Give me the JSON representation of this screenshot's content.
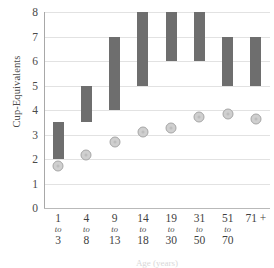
{
  "chart_data": {
    "type": "bar",
    "title": "",
    "xlabel": "Age (years)",
    "ylabel": "Cup-Equivalents",
    "ylim": [
      0,
      8
    ],
    "grid": true,
    "legend": "none",
    "categories": [
      "1 to 3",
      "4 to 8",
      "9 to 13",
      "14 to 18",
      "19 to 30",
      "31 to 50",
      "51 to 70",
      "71 +"
    ],
    "category_lines": [
      {
        "line1": "1",
        "line2": "to",
        "line3": "3"
      },
      {
        "line1": "4",
        "line2": "to",
        "line3": "8"
      },
      {
        "line1": "9",
        "line2": "to",
        "line3": "13"
      },
      {
        "line1": "14",
        "line2": "to",
        "line3": "18"
      },
      {
        "line1": "19",
        "line2": "to",
        "line3": "30"
      },
      {
        "line1": "31",
        "line2": "to",
        "line3": "50"
      },
      {
        "line1": "51",
        "line2": "to",
        "line3": "70"
      },
      {
        "line1": "71 +",
        "line2": "",
        "line3": ""
      }
    ],
    "y_ticks": [
      0,
      1,
      2,
      3,
      4,
      5,
      6,
      7,
      8
    ],
    "series": [
      {
        "name": "Recommended range",
        "type": "range-bar",
        "color": "#6e6e6e",
        "low": [
          2.0,
          3.5,
          4.0,
          5.0,
          6.0,
          6.0,
          5.0,
          5.0
        ],
        "high": [
          3.5,
          5.0,
          7.0,
          8.0,
          8.0,
          8.0,
          7.0,
          7.0
        ]
      },
      {
        "name": "Average intake",
        "type": "marker",
        "color": "#cfcfcf",
        "edge_color": "#a6a6a6",
        "values": [
          1.7,
          2.15,
          2.7,
          3.1,
          3.25,
          3.7,
          3.85,
          3.65
        ]
      }
    ]
  }
}
